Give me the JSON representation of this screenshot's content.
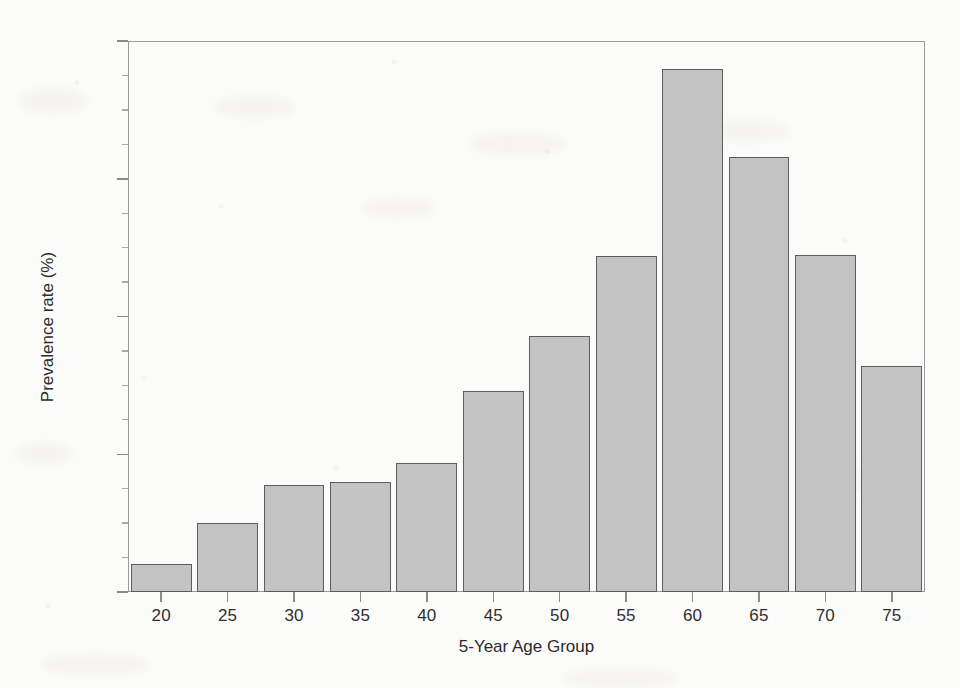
{
  "chart_data": {
    "type": "bar",
    "title": "",
    "xlabel": "5-Year Age Group",
    "ylabel": "Prevalence rate (%)",
    "categories": [
      "20",
      "25",
      "30",
      "35",
      "40",
      "45",
      "50",
      "55",
      "60",
      "65",
      "70",
      "75"
    ],
    "values": [
      1.0,
      2.5,
      3.9,
      4.0,
      4.7,
      7.3,
      9.3,
      12.2,
      19.0,
      15.8,
      12.25,
      8.2
    ],
    "ylim": [
      0,
      20
    ],
    "yticks": [
      0,
      5,
      10,
      15,
      20
    ],
    "ytick_labels": [
      "0%",
      "5%",
      "10%",
      "15%",
      "20%"
    ],
    "yminor_step": 1.25,
    "xtick_labels": [
      "20",
      "25",
      "30",
      "35",
      "40",
      "45",
      "50",
      "55",
      "60",
      "65",
      "70",
      "75"
    ],
    "grid": false,
    "legend": false,
    "legend_position": "none",
    "bar_fill_color": "#c3c3c3",
    "bar_edge_color": "#5e5e5e",
    "axis_color": "#9a9a9a",
    "background_color": "#fbfbf9",
    "text_color": "#2b2b2b"
  }
}
